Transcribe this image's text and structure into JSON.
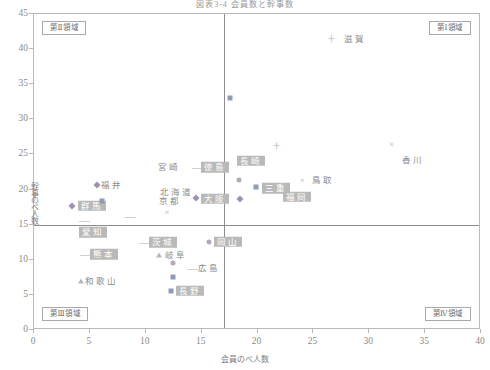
{
  "chart_data": {
    "type": "scatter",
    "title": "図表3-4 会員数と幹事数",
    "xlabel": "会員のべ人数",
    "ylabel": "幹事のべ人数",
    "xlim": [
      0,
      40
    ],
    "ylim": [
      0,
      45
    ],
    "xticks": [
      0,
      5,
      10,
      15,
      20,
      25,
      30,
      35,
      40
    ],
    "yticks": [
      0,
      5,
      10,
      15,
      20,
      25,
      30,
      35,
      40,
      45
    ],
    "grid": false,
    "legend": "none",
    "divider_x": 17.0,
    "divider_y": 15.0,
    "quadrant_labels": [
      {
        "key": "q1",
        "text": "第Ⅰ領域",
        "corner": "top-right"
      },
      {
        "key": "q2",
        "text": "第Ⅱ領域",
        "corner": "top-left"
      },
      {
        "key": "q3",
        "text": "第Ⅲ領域",
        "corner": "bottom-left"
      },
      {
        "key": "q4",
        "text": "第Ⅳ領域",
        "corner": "bottom-right"
      }
    ],
    "points": [
      {
        "label": "滋賀",
        "x": 26.6,
        "y": 41.5,
        "marker": "plus",
        "style": "plain",
        "lx": 27.7,
        "ly": 41.5
      },
      {
        "label": "",
        "x": 17.5,
        "y": 33.0,
        "marker": "square",
        "style": "none",
        "lx": 0,
        "ly": 0
      },
      {
        "label": "香川",
        "x": 32.0,
        "y": 26.5,
        "marker": "cross",
        "style": "plain",
        "lx": 32.9,
        "ly": 24.2
      },
      {
        "label": "",
        "x": 21.7,
        "y": 26.2,
        "marker": "plus",
        "style": "none",
        "lx": 0,
        "ly": 0
      },
      {
        "label": "長崎",
        "x": 20.4,
        "y": 24.1,
        "marker": "square-dark",
        "style": "boxed",
        "lx": 18.2,
        "ly": 24.1
      },
      {
        "label": "徳島",
        "x": 14.6,
        "y": 23.2,
        "marker": "dash",
        "style": "boxed",
        "lx": 14.9,
        "ly": 23.2
      },
      {
        "label": "宮崎",
        "x": 11.1,
        "y": 23.2,
        "marker": "none",
        "style": "plain",
        "lx": 11.1,
        "ly": 23.2
      },
      {
        "label": "鳥取",
        "x": 24.0,
        "y": 21.3,
        "marker": "cross",
        "style": "plain",
        "lx": 24.9,
        "ly": 21.4
      },
      {
        "label": "三重",
        "x": 19.9,
        "y": 20.4,
        "marker": "square",
        "style": "boxed",
        "lx": 20.4,
        "ly": 20.2
      },
      {
        "label": "",
        "x": 18.3,
        "y": 21.3,
        "marker": "circle",
        "style": "none",
        "lx": 0,
        "ly": 0
      },
      {
        "label": "福岡",
        "x": 22.7,
        "y": 19.0,
        "marker": "none",
        "style": "boxed",
        "lx": 22.3,
        "ly": 19.0
      },
      {
        "label": "福井",
        "x": 5.6,
        "y": 20.6,
        "marker": "diamond",
        "style": "plain",
        "lx": 6.0,
        "ly": 20.6
      },
      {
        "label": "北海道",
        "x": 12.0,
        "y": 19.6,
        "marker": "none",
        "style": "plain",
        "lx": 11.3,
        "ly": 19.6
      },
      {
        "label": "大阪",
        "x": 14.5,
        "y": 18.8,
        "marker": "diamond",
        "style": "boxed",
        "lx": 14.9,
        "ly": 18.7
      },
      {
        "label": "京都",
        "x": 11.8,
        "y": 18.3,
        "marker": "none",
        "style": "plain",
        "lx": 11.2,
        "ly": 18.3
      },
      {
        "label": "群馬",
        "x": 3.4,
        "y": 17.7,
        "marker": "diamond",
        "style": "boxed",
        "lx": 3.9,
        "ly": 17.7
      },
      {
        "label": "",
        "x": 6.1,
        "y": 18.4,
        "marker": "square",
        "style": "none",
        "lx": 0,
        "ly": 0
      },
      {
        "label": "",
        "x": 18.4,
        "y": 18.6,
        "marker": "diamond",
        "style": "none",
        "lx": 0,
        "ly": 0
      },
      {
        "label": "",
        "x": 11.9,
        "y": 16.8,
        "marker": "cross",
        "style": "none",
        "lx": 0,
        "ly": 0
      },
      {
        "label": "愛知",
        "x": 4.4,
        "y": 13.9,
        "marker": "none",
        "style": "boxed",
        "lx": 4.0,
        "ly": 13.9
      },
      {
        "label": "茨城",
        "x": 9.9,
        "y": 12.5,
        "marker": "dash",
        "style": "boxed",
        "lx": 10.3,
        "ly": 12.5
      },
      {
        "label": "岡山",
        "x": 15.7,
        "y": 12.6,
        "marker": "circle",
        "style": "boxed",
        "lx": 16.1,
        "ly": 12.6
      },
      {
        "label": "熊本",
        "x": 4.6,
        "y": 10.8,
        "marker": "dash",
        "style": "boxed",
        "lx": 5.0,
        "ly": 10.8
      },
      {
        "label": "岐阜",
        "x": 11.2,
        "y": 10.7,
        "marker": "tri",
        "style": "plain",
        "lx": 11.7,
        "ly": 10.7
      },
      {
        "label": "広島",
        "x": 14.2,
        "y": 8.9,
        "marker": "dash",
        "style": "plain",
        "lx": 14.7,
        "ly": 8.9
      },
      {
        "label": "",
        "x": 12.4,
        "y": 9.6,
        "marker": "circle",
        "style": "none",
        "lx": 0,
        "ly": 0
      },
      {
        "label": "和歌山",
        "x": 4.2,
        "y": 7.0,
        "marker": "tri",
        "style": "plain",
        "lx": 4.6,
        "ly": 7.0
      },
      {
        "label": "",
        "x": 12.4,
        "y": 7.6,
        "marker": "square",
        "style": "none",
        "lx": 0,
        "ly": 0
      },
      {
        "label": "長野",
        "x": 12.3,
        "y": 5.6,
        "marker": "square",
        "style": "boxed",
        "lx": 12.7,
        "ly": 5.6
      },
      {
        "label": "",
        "x": 4.5,
        "y": 15.6,
        "marker": "dash",
        "style": "none",
        "lx": 0,
        "ly": 0
      },
      {
        "label": "",
        "x": 8.6,
        "y": 16.3,
        "marker": "dash",
        "style": "none",
        "lx": 0,
        "ly": 0
      }
    ]
  }
}
